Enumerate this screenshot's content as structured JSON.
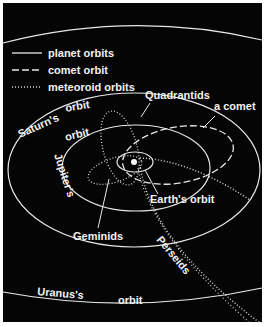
{
  "legend": {
    "items": [
      {
        "style": "solid",
        "label": "planet orbits"
      },
      {
        "style": "dashed",
        "label": "comet orbit"
      },
      {
        "style": "dotted",
        "label": "meteoroid orbits"
      }
    ]
  },
  "labels": {
    "quadrantids": "Quadrantids",
    "a_comet": "a comet",
    "saturn": "Saturn's",
    "saturn_orbit": "orbit",
    "jupiter": "Jupiter's",
    "jupiter_orbit": "orbit",
    "earth_orbit": "Earth's orbit",
    "geminids": "Geminids",
    "perseids": "Perseids",
    "uranus": "Uranus's",
    "uranus_orbit": "orbit"
  },
  "colors": {
    "background": "#050505",
    "lines": "#e8e8e8",
    "text": "#f2f2f2",
    "border": "#ffffff"
  }
}
